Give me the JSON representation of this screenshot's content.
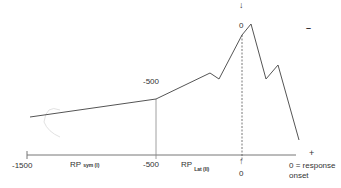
{
  "diagram": {
    "x_axis": {
      "ticks": [
        {
          "label": "-1500",
          "x": 27
        },
        {
          "label": "-500",
          "x": 156
        },
        {
          "label": "0",
          "x": 242
        }
      ],
      "end_label": "0 = response",
      "end_label_line2": "onset",
      "plus_sign": "+"
    },
    "polarity": {
      "minus_sign": "–"
    },
    "annotations": {
      "upper_500": "-500",
      "upper_0": "0",
      "arrow_down": "↓",
      "arrow_up": "↑"
    },
    "phases": [
      {
        "main": "RP",
        "sub": "sym (I)"
      },
      {
        "main": "RP",
        "sub": "Lat (II)"
      }
    ],
    "waveform_points": [
      [
        30,
        117
      ],
      [
        156,
        99
      ],
      [
        210,
        73
      ],
      [
        219,
        79
      ],
      [
        242,
        35
      ],
      [
        251,
        24
      ],
      [
        266,
        79
      ],
      [
        278,
        65
      ],
      [
        299,
        140
      ]
    ],
    "colors": {
      "line": "#555555",
      "axis": "#777777",
      "faint": "#dddddd"
    }
  }
}
